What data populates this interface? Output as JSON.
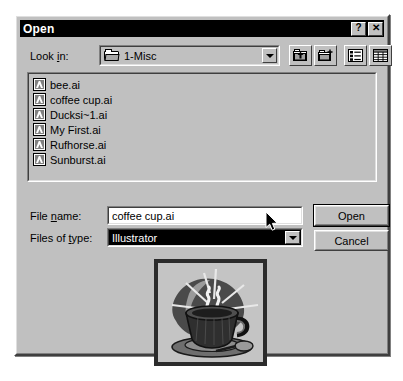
{
  "dialog": {
    "title": "Open",
    "title_buttons": [
      {
        "name": "help-button",
        "label": "?"
      },
      {
        "name": "close-button",
        "label": "✕"
      }
    ]
  },
  "lookin": {
    "label": "Look in:",
    "value": "1-Misc",
    "icon": "folder-icon",
    "dropdown_icon": "chevron-down-icon"
  },
  "toolbar": {
    "buttons": [
      {
        "name": "up-one-level-button",
        "tooltip": "Up One Level"
      },
      {
        "name": "create-new-folder-button",
        "tooltip": "Create New Folder"
      },
      {
        "name": "list-view-button",
        "tooltip": "List"
      },
      {
        "name": "details-view-button",
        "tooltip": "Details"
      }
    ]
  },
  "filelist": {
    "items": [
      {
        "name": "bee.ai",
        "icon": "illustrator-file-icon"
      },
      {
        "name": "coffee cup.ai",
        "icon": "illustrator-file-icon"
      },
      {
        "name": "Ducksi~1.ai",
        "icon": "illustrator-file-icon"
      },
      {
        "name": "My First.ai",
        "icon": "illustrator-file-icon"
      },
      {
        "name": "Rufhorse.ai",
        "icon": "illustrator-file-icon"
      },
      {
        "name": "Sunburst.ai",
        "icon": "illustrator-file-icon"
      }
    ]
  },
  "form": {
    "filename_label": "File name:",
    "filename_value": "coffee cup.ai",
    "filetype_label": "Files of type:",
    "filetype_value": "Illustrator"
  },
  "buttons": {
    "open": "Open",
    "cancel": "Cancel"
  },
  "preview": {
    "name": "coffee-cup-clipart-preview",
    "alt": "Coffee cup clipart thumbnail"
  },
  "colors": {
    "face": "#c0c0c0",
    "titlebar": "#000000",
    "titlebar_text": "#ffffff",
    "field_bg": "#ffffff",
    "selection_bg": "#000000",
    "selection_text": "#ffffff",
    "shadow": "#3f3f3f",
    "highlight": "#ffffff",
    "page_bg": "#ffffff"
  },
  "cursor": {
    "name": "mouse-pointer",
    "x": 265,
    "y": 211
  }
}
